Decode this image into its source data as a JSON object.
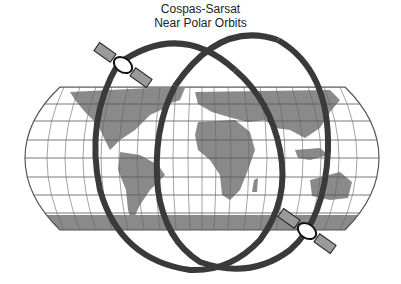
{
  "title": "Cospas-Sarsat",
  "subtitle": "Near Polar Orbits",
  "colors": {
    "land": "#8a8a8a",
    "orbit": "#3a3a3a",
    "grid": "#555555",
    "panel": "#9a9a9a"
  },
  "satellites": [
    {
      "name": "satellite-upper-left"
    },
    {
      "name": "satellite-lower-right"
    }
  ],
  "orbits": [
    {
      "name": "orbit-left"
    },
    {
      "name": "orbit-right"
    }
  ]
}
